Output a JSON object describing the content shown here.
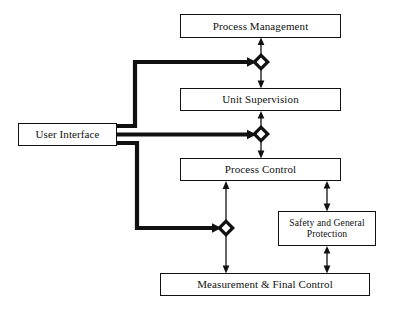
{
  "diagram": {
    "background_color": "#ffffff",
    "line_color": "#111111",
    "nodes": [
      {
        "id": "user-interface",
        "label": "User Interface",
        "x": 18,
        "y": 123,
        "width": 99,
        "height": 23
      },
      {
        "id": "process-management",
        "label": "Process Management",
        "x": 180,
        "y": 14,
        "width": 161,
        "height": 24
      },
      {
        "id": "unit-supervision",
        "label": "Unit Supervision",
        "x": 180,
        "y": 88,
        "width": 161,
        "height": 23
      },
      {
        "id": "process-control",
        "label": "Process Control",
        "x": 180,
        "y": 158,
        "width": 161,
        "height": 23
      },
      {
        "id": "safety-and-general-protection",
        "label": "Safety and General Protection",
        "line_1": "Safety and General",
        "line_2": "Protection",
        "x": 278,
        "y": 211,
        "width": 98,
        "height": 35
      },
      {
        "id": "measurement-and-final-control",
        "label": "Measurement & Final Control",
        "x": 160,
        "y": 273,
        "width": 210,
        "height": 23
      }
    ],
    "junctions": [
      {
        "id": "junction-management",
        "x": 261,
        "y": 62
      },
      {
        "id": "junction-supervision",
        "x": 261,
        "y": 134
      },
      {
        "id": "junction-measurement",
        "x": 226,
        "y": 228
      }
    ],
    "connections": [
      {
        "id": "user-interface-to-junction-management",
        "style": "thick-bus",
        "from": "user-interface",
        "to": "junction-management"
      },
      {
        "id": "user-interface-to-junction-supervision",
        "style": "thick-bus",
        "from": "user-interface",
        "to": "junction-supervision"
      },
      {
        "id": "user-interface-to-junction-measurement",
        "style": "thick-bus",
        "from": "user-interface",
        "to": "junction-measurement"
      },
      {
        "id": "junction-management-to-process-management",
        "style": "arrow-up",
        "from": "junction-management",
        "to": "process-management"
      },
      {
        "id": "junction-management-to-unit-supervision",
        "style": "arrow-down",
        "from": "junction-management",
        "to": "unit-supervision"
      },
      {
        "id": "unit-supervision-to-junction-supervision",
        "style": "arrow-up",
        "from": "unit-supervision",
        "to": "junction-supervision"
      },
      {
        "id": "junction-supervision-to-process-control",
        "style": "arrow-down",
        "from": "junction-supervision",
        "to": "process-control"
      },
      {
        "id": "process-control-to-safety",
        "style": "double-arrow",
        "from": "process-control",
        "to": "safety-and-general-protection"
      },
      {
        "id": "safety-to-measurement",
        "style": "double-arrow",
        "from": "safety-and-general-protection",
        "to": "measurement-and-final-control"
      },
      {
        "id": "measurement-to-junction-measurement",
        "style": "double-arrow",
        "from": "measurement-and-final-control",
        "to": "junction-measurement"
      },
      {
        "id": "junction-measurement-to-process-control",
        "style": "double-arrow",
        "from": "junction-measurement",
        "to": "process-control"
      }
    ]
  }
}
